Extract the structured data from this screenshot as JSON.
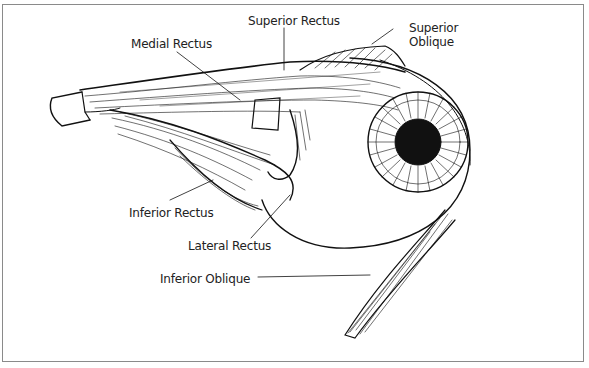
{
  "diagram": {
    "labels": [
      {
        "id": "superior-rectus",
        "text": "Superior Rectus"
      },
      {
        "id": "superior-oblique-1",
        "text": "Superior"
      },
      {
        "id": "superior-oblique-2",
        "text": "Oblique"
      },
      {
        "id": "medial-rectus",
        "text": "Medial Rectus"
      },
      {
        "id": "inferior-rectus",
        "text": "Inferior Rectus"
      },
      {
        "id": "lateral-rectus",
        "text": "Lateral Rectus"
      },
      {
        "id": "inferior-oblique",
        "text": "Inferior Oblique"
      }
    ],
    "colors": {
      "ink": "#111111",
      "border": "#8a8a8a",
      "background": "#ffffff"
    }
  }
}
